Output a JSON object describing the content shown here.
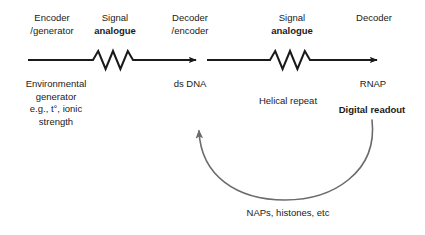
{
  "diagram": {
    "colors": {
      "arrow": "#1a1a1a",
      "feedback_curve": "#6b6b6b",
      "text": "#1a1a1a",
      "background": "#ffffff"
    },
    "top_labels": [
      {
        "id": "encoder-generator",
        "line1": "Encoder",
        "line2": "/generator",
        "bold2": false
      },
      {
        "id": "signal-analogue-1",
        "line1": "Signal",
        "line2": "analogue",
        "bold2": true
      },
      {
        "id": "decoder-encoder",
        "line1": "Decoder",
        "line2": "/encoder",
        "bold2": false
      },
      {
        "id": "signal-analogue-2",
        "line1": "Signal",
        "line2": "analogue",
        "bold2": true
      },
      {
        "id": "decoder",
        "line1": "Decoder",
        "line2": "",
        "bold2": false
      }
    ],
    "bottom_labels": {
      "environmental_generator": {
        "lines": [
          "Environmental",
          "generator",
          "e.g., t°, ionic",
          "strength"
        ],
        "bold": false
      },
      "ds_dna": {
        "lines": [
          "ds DNA"
        ],
        "bold": false
      },
      "helical_repeat": {
        "lines": [
          "Helical repeat"
        ],
        "bold": false
      },
      "rnap": {
        "lines": [
          "RNAP"
        ],
        "bold": false
      },
      "digital_readout": {
        "lines": [
          "Digital readout"
        ],
        "bold": true
      },
      "feedback_label": {
        "lines": [
          "NAPs, histones, etc"
        ],
        "bold": false
      }
    },
    "arrows": [
      {
        "id": "arrow-1",
        "from_x": 28,
        "to_x": 201,
        "y": 60,
        "zigzag": true
      },
      {
        "id": "arrow-2",
        "from_x": 207,
        "to_x": 382,
        "y": 60,
        "zigzag": true
      }
    ],
    "feedback_arrow": {
      "id": "feedback-curve",
      "description": "curved arrow from Digital readout back to ds DNA",
      "start": [
        372,
        120
      ],
      "end": [
        198,
        124
      ]
    }
  }
}
